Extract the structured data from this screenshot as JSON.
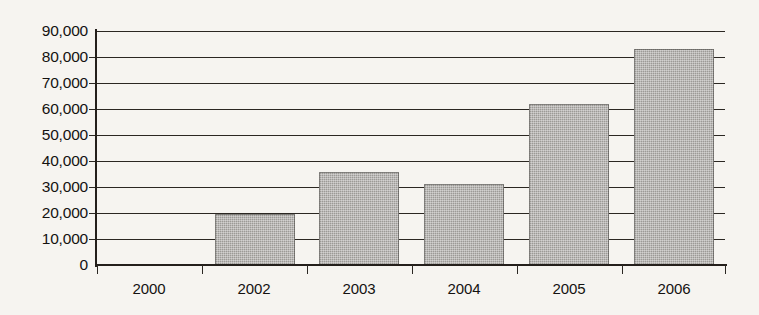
{
  "chart_data": {
    "type": "bar",
    "title": "",
    "subtitle": "",
    "xlabel": "",
    "ylabel": "",
    "categories": [
      "2000",
      "2002",
      "2003",
      "2004",
      "2005",
      "2006"
    ],
    "values": [
      500,
      19500,
      35800,
      31000,
      62000,
      83000
    ],
    "series": [
      {
        "name": "",
        "values": [
          500,
          19500,
          35800,
          31000,
          62000,
          83000
        ]
      }
    ],
    "ylim": [
      0,
      90000
    ],
    "ytick_values": [
      0,
      10000,
      20000,
      30000,
      40000,
      50000,
      60000,
      70000,
      80000,
      90000
    ],
    "ytick_labels": [
      "0",
      "10,000",
      "20,000",
      "30,000",
      "40,000",
      "50,000",
      "60,000",
      "70,000",
      "80,000",
      "90,000"
    ],
    "xtick_labels": [
      "2000",
      "2002",
      "2003",
      "2004",
      "2005",
      "2006"
    ],
    "grid": true,
    "grid_axis": "y",
    "legend": false,
    "legend_position": "none",
    "annotations": [],
    "colors": {
      "background": "#f6f4f0",
      "bar_fill": "#9c9a96",
      "axis": "#241f1b",
      "gridline": "#2b2722",
      "text": "#141210"
    }
  }
}
